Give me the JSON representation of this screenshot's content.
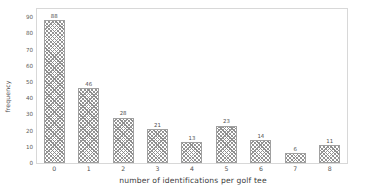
{
  "chart_data": {
    "type": "bar",
    "title": "",
    "subtitle": "",
    "xlabel": "number of identifications per golf tee",
    "ylabel": "frequency",
    "categories": [
      "0",
      "1",
      "2",
      "3",
      "4",
      "5",
      "6",
      "7",
      "8"
    ],
    "values": [
      88,
      46,
      28,
      21,
      13,
      23,
      14,
      6,
      11
    ],
    "data_labels": [
      "88",
      "46",
      "28",
      "21",
      "13",
      "23",
      "14",
      "6",
      "11"
    ],
    "ylim": [
      0,
      95
    ],
    "yticks": [
      0,
      10,
      20,
      30,
      40,
      50,
      60,
      70,
      80,
      90
    ],
    "ytick_labels": [
      "0",
      "10",
      "20",
      "30",
      "40",
      "50",
      "60",
      "70",
      "80",
      "90"
    ],
    "grid": false,
    "legend": null,
    "legend_position": "none",
    "series": [
      {
        "name": "frequency",
        "values": [
          88,
          46,
          28,
          21,
          13,
          23,
          14,
          6,
          11
        ]
      }
    ],
    "style": {
      "bar_fill": "#ffffff",
      "bar_hatch_color": "#8e8e8e",
      "bar_hatch": "crosshatch",
      "bar_edge_color": "#a0a0a0",
      "frame_color": "#d8d8d8",
      "text_color": "#4f4f4f",
      "background": "#ffffff"
    }
  }
}
